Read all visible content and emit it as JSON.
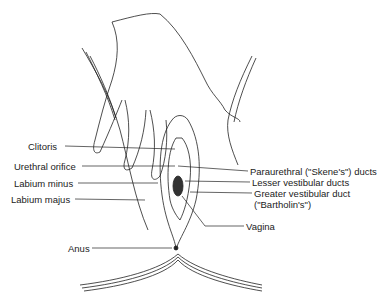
{
  "diagram": {
    "labels_left": [
      {
        "id": "clitoris",
        "text": "Clitoris"
      },
      {
        "id": "urethral-orifice",
        "text": "Urethral orifice"
      },
      {
        "id": "labium-minus",
        "text": "Labium minus"
      },
      {
        "id": "labium-majus",
        "text": "Labium majus"
      },
      {
        "id": "anus",
        "text": "Anus"
      }
    ],
    "labels_right": [
      {
        "id": "paraurethral-ducts",
        "text": "Paraurethral (\"Skene's\") ducts"
      },
      {
        "id": "lesser-vestibular-ducts",
        "text": "Lesser vestibular ducts"
      },
      {
        "id": "greater-vestibular-duct",
        "text": "Greater vestibular duct",
        "text2": "(\"Bartholin's\")"
      },
      {
        "id": "vagina",
        "text": "Vagina"
      }
    ],
    "colors": {
      "line": "#222222",
      "background": "#ffffff"
    }
  }
}
